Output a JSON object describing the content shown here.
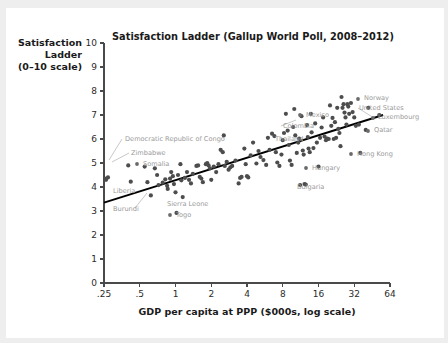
{
  "figure": {
    "background": "#eeeeee",
    "panel_background": "#ffffff"
  },
  "chart_data": {
    "type": "scatter",
    "title": "Satisfaction Ladder (Gallup World Poll, 2008–2012)",
    "xlabel": "GDP per capita at PPP ($000s, log scale)",
    "ylabel_lines": [
      "Satisfaction",
      "Ladder",
      "(0–10 scale)"
    ],
    "ylabel": "Satisfaction Ladder (0–10 scale)",
    "x_scale": "log2",
    "xlim": [
      0.25,
      64
    ],
    "ylim": [
      0,
      10
    ],
    "xticks": [
      0.25,
      0.5,
      1,
      2,
      4,
      8,
      16,
      32,
      64
    ],
    "xtick_labels": [
      ".25",
      ".5",
      "1",
      "2",
      "4",
      "8",
      "16",
      "32",
      "64"
    ],
    "yticks": [
      0,
      1,
      2,
      3,
      4,
      5,
      6,
      7,
      8,
      9,
      10
    ],
    "ytick_labels": [
      "0",
      "1",
      "2",
      "3",
      "4",
      "5",
      "6",
      "7",
      "8",
      "9",
      "10"
    ],
    "grid": false,
    "legend": false,
    "marker_color": "#4d4d4d",
    "fit_line_color": "#000000",
    "fit_line": {
      "x_start": 0.25,
      "y_start": 3.35,
      "x_end": 56.0,
      "y_end": 7.0
    },
    "points": [
      [
        0.26,
        4.35
      ],
      [
        0.27,
        4.4
      ],
      [
        0.26,
        4.3
      ],
      [
        0.4,
        4.9
      ],
      [
        0.42,
        4.22
      ],
      [
        0.55,
        4.85
      ],
      [
        0.58,
        4.2
      ],
      [
        0.62,
        3.65
      ],
      [
        0.67,
        4.78
      ],
      [
        0.7,
        4.5
      ],
      [
        0.72,
        4.08
      ],
      [
        0.78,
        4.18
      ],
      [
        0.82,
        4.32
      ],
      [
        0.85,
        4.05
      ],
      [
        0.86,
        3.92
      ],
      [
        0.9,
        4.35
      ],
      [
        0.92,
        4.62
      ],
      [
        0.95,
        4.45
      ],
      [
        0.97,
        4.12
      ],
      [
        1.0,
        3.78
      ],
      [
        1.02,
        2.92
      ],
      [
        1.05,
        4.5
      ],
      [
        1.1,
        4.95
      ],
      [
        1.12,
        4.28
      ],
      [
        1.15,
        3.58
      ],
      [
        1.2,
        4.38
      ],
      [
        1.25,
        4.62
      ],
      [
        1.3,
        4.3
      ],
      [
        1.35,
        4.15
      ],
      [
        1.4,
        4.55
      ],
      [
        1.5,
        4.88
      ],
      [
        1.55,
        4.9
      ],
      [
        1.6,
        4.42
      ],
      [
        1.65,
        4.35
      ],
      [
        1.7,
        4.2
      ],
      [
        1.8,
        4.95
      ],
      [
        1.85,
        5.0
      ],
      [
        1.9,
        4.9
      ],
      [
        1.95,
        4.78
      ],
      [
        2.0,
        4.3
      ],
      [
        2.1,
        4.85
      ],
      [
        2.2,
        4.62
      ],
      [
        2.3,
        4.95
      ],
      [
        2.4,
        5.55
      ],
      [
        2.5,
        5.45
      ],
      [
        2.55,
        6.15
      ],
      [
        2.6,
        4.88
      ],
      [
        2.7,
        5.05
      ],
      [
        2.8,
        4.72
      ],
      [
        2.9,
        4.82
      ],
      [
        3.0,
        4.88
      ],
      [
        3.2,
        5.1
      ],
      [
        3.4,
        4.15
      ],
      [
        3.5,
        4.38
      ],
      [
        3.6,
        4.42
      ],
      [
        3.8,
        5.6
      ],
      [
        3.9,
        4.95
      ],
      [
        4.0,
        4.45
      ],
      [
        4.1,
        4.4
      ],
      [
        4.3,
        5.32
      ],
      [
        4.5,
        5.85
      ],
      [
        4.8,
        4.98
      ],
      [
        5.0,
        5.5
      ],
      [
        5.2,
        5.25
      ],
      [
        5.5,
        5.12
      ],
      [
        5.8,
        4.92
      ],
      [
        6.0,
        6.05
      ],
      [
        6.2,
        5.55
      ],
      [
        6.5,
        6.22
      ],
      [
        6.8,
        6.12
      ],
      [
        7.0,
        5.45
      ],
      [
        7.2,
        5.02
      ],
      [
        7.5,
        4.88
      ],
      [
        7.8,
        5.35
      ],
      [
        8.0,
        5.95
      ],
      [
        8.2,
        6.25
      ],
      [
        8.5,
        7.05
      ],
      [
        8.8,
        6.35
      ],
      [
        9.0,
        5.75
      ],
      [
        9.2,
        5.1
      ],
      [
        9.5,
        4.92
      ],
      [
        9.8,
        6.5
      ],
      [
        10.0,
        7.25
      ],
      [
        10.2,
        6.15
      ],
      [
        10.5,
        5.42
      ],
      [
        10.8,
        5.85
      ],
      [
        11.0,
        6.02
      ],
      [
        11.2,
        4.08
      ],
      [
        11.5,
        6.95
      ],
      [
        11.8,
        5.52
      ],
      [
        12.0,
        5.35
      ],
      [
        12.2,
        4.12
      ],
      [
        12.5,
        4.1
      ],
      [
        12.8,
        6.58
      ],
      [
        13.0,
        6.08
      ],
      [
        13.2,
        5.6
      ],
      [
        13.5,
        5.45
      ],
      [
        13.8,
        7.05
      ],
      [
        14.0,
        6.28
      ],
      [
        14.5,
        5.62
      ],
      [
        15.0,
        6.65
      ],
      [
        15.5,
        5.85
      ],
      [
        16.0,
        4.85
      ],
      [
        16.5,
        6.05
      ],
      [
        17.0,
        6.48
      ],
      [
        17.5,
        6.9
      ],
      [
        18.0,
        6.1
      ],
      [
        18.5,
        5.95
      ],
      [
        19.0,
        6.02
      ],
      [
        19.5,
        6.0
      ],
      [
        20.0,
        7.4
      ],
      [
        20.5,
        6.55
      ],
      [
        21.0,
        6.88
      ],
      [
        21.5,
        6.0
      ],
      [
        22.0,
        6.7
      ],
      [
        22.5,
        6.05
      ],
      [
        23.0,
        7.3
      ],
      [
        23.5,
        6.42
      ],
      [
        24.0,
        6.25
      ],
      [
        24.5,
        5.7
      ],
      [
        25.0,
        7.75
      ],
      [
        25.5,
        7.3
      ],
      [
        26.0,
        7.45
      ],
      [
        26.5,
        7.1
      ],
      [
        27.0,
        6.9
      ],
      [
        27.5,
        6.6
      ],
      [
        28.0,
        7.45
      ],
      [
        28.5,
        7.35
      ],
      [
        29.0,
        7.05
      ],
      [
        30.0,
        7.5
      ],
      [
        31.0,
        7.12
      ],
      [
        32.0,
        6.9
      ],
      [
        33.0,
        6.55
      ],
      [
        35.0,
        6.6
      ],
      [
        36.0,
        5.42
      ],
      [
        40.0,
        6.38
      ],
      [
        42.0,
        7.3
      ],
      [
        52.0,
        7.0
      ]
    ],
    "annotations": [
      {
        "label": "Democratic Republic of Congo",
        "side": "right",
        "text_x": 125,
        "text_y": 141,
        "leader": [
          [
            122,
            139
          ],
          [
            109,
            160
          ]
        ],
        "dot": null
      },
      {
        "label": "Zimbabwe",
        "side": "right",
        "text_x": 131,
        "text_y": 155,
        "leader": [
          [
            129,
            153
          ],
          [
            112,
            162
          ]
        ],
        "dot": null
      },
      {
        "label": "Somalia",
        "side": "right",
        "text_x": 143,
        "text_y": 166,
        "leader": null,
        "dot": [
          137,
          164
        ]
      },
      {
        "label": "Liberia",
        "side": "right",
        "text_x": 113,
        "text_y": 193,
        "leader": null,
        "dot": null
      },
      {
        "label": "Burundi",
        "side": "right",
        "text_x": 113,
        "text_y": 211,
        "leader": [
          [
            135,
            208
          ],
          [
            147,
            193
          ]
        ],
        "dot": null
      },
      {
        "label": "Sierra Leone",
        "side": "right",
        "text_x": 167,
        "text_y": 206,
        "leader": null,
        "dot": null
      },
      {
        "label": "Togo",
        "side": "right",
        "text_x": 176,
        "text_y": 217,
        "leader": null,
        "dot": [
          170,
          215
        ]
      },
      {
        "label": "Mexico",
        "side": "right",
        "text_x": 306,
        "text_y": 117,
        "leader": null,
        "dot": [
          300,
          115
        ]
      },
      {
        "label": "Colombia",
        "side": "right",
        "text_x": 283,
        "text_y": 128,
        "leader": [
          [
            281,
            126
          ],
          [
            296,
            120
          ]
        ],
        "dot": null
      },
      {
        "label": "Thailand",
        "side": "right",
        "text_x": 275,
        "text_y": 141,
        "leader": null,
        "dot": null
      },
      {
        "label": "Hungary",
        "side": "right",
        "text_x": 312,
        "text_y": 170,
        "leader": null,
        "dot": [
          306,
          168
        ]
      },
      {
        "label": "Bulgaria",
        "side": "right",
        "text_x": 297,
        "text_y": 189,
        "leader": null,
        "dot": null
      },
      {
        "label": "Hong Kong",
        "side": "right",
        "text_x": 357,
        "text_y": 156,
        "leader": null,
        "dot": [
          351,
          154
        ]
      },
      {
        "label": "Norway",
        "side": "right",
        "text_x": 364,
        "text_y": 100,
        "leader": null,
        "dot": [
          358,
          99
        ]
      },
      {
        "label": "United States",
        "side": "right",
        "text_x": 359,
        "text_y": 110,
        "leader": [
          [
            358,
            108
          ],
          [
            374,
            118
          ]
        ],
        "dot": null
      },
      {
        "label": "Luxembourg",
        "side": "right",
        "text_x": 378,
        "text_y": 119,
        "leader": null,
        "dot": [
          373,
          118
        ]
      },
      {
        "label": "Qatar",
        "side": "right",
        "text_x": 374,
        "text_y": 132,
        "leader": null,
        "dot": [
          368,
          131
        ]
      }
    ]
  }
}
